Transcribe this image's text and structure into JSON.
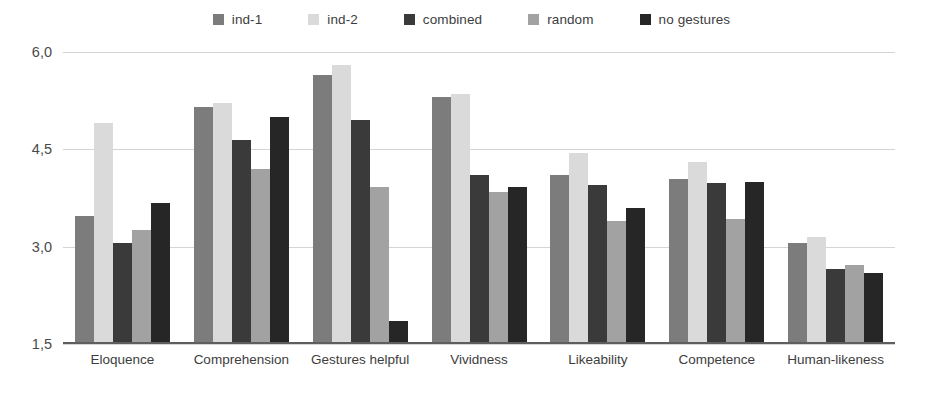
{
  "chart_data": {
    "type": "bar",
    "title": "",
    "subtitle": "",
    "xlabel": "",
    "ylabel": "",
    "ylim": [
      1.5,
      6.0
    ],
    "yticks": [
      "6,0",
      "4,5",
      "3,0",
      "1,5"
    ],
    "ytick_values": [
      6.0,
      4.5,
      3.0,
      1.5
    ],
    "grid": true,
    "legend_position": "top-center",
    "categories": [
      "Eloquence",
      "Comprehension",
      "Gestures helpful",
      "Vividness",
      "Likeability",
      "Competence",
      "Human-likeness"
    ],
    "series": [
      {
        "name": "ind-1",
        "color": "#7c7c7c",
        "values": [
          3.48,
          5.15,
          5.65,
          5.3,
          4.1,
          4.05,
          3.05
        ]
      },
      {
        "name": "ind-2",
        "color": "#dadada",
        "values": [
          4.9,
          5.22,
          5.8,
          5.35,
          4.45,
          4.3,
          3.15
        ]
      },
      {
        "name": "combined",
        "color": "#3a3a3a",
        "values": [
          3.05,
          4.65,
          4.95,
          4.1,
          3.95,
          3.98,
          2.65
        ]
      },
      {
        "name": "random",
        "color": "#a2a2a2",
        "values": [
          3.25,
          4.2,
          3.92,
          3.85,
          3.4,
          3.42,
          2.72
        ]
      },
      {
        "name": "no gestures",
        "color": "#262626",
        "values": [
          3.68,
          5.0,
          1.85,
          3.92,
          3.6,
          4.0,
          2.6
        ]
      }
    ]
  },
  "legend": {
    "items": [
      {
        "label": "ind-1",
        "color": "#7c7c7c"
      },
      {
        "label": "ind-2",
        "color": "#dadada"
      },
      {
        "label": "combined",
        "color": "#3a3a3a"
      },
      {
        "label": "random",
        "color": "#a2a2a2"
      },
      {
        "label": "no gestures",
        "color": "#262626"
      }
    ]
  },
  "axis": {
    "grid_color": "#d4d4d4",
    "baseline_color": "#5e5e5e"
  }
}
